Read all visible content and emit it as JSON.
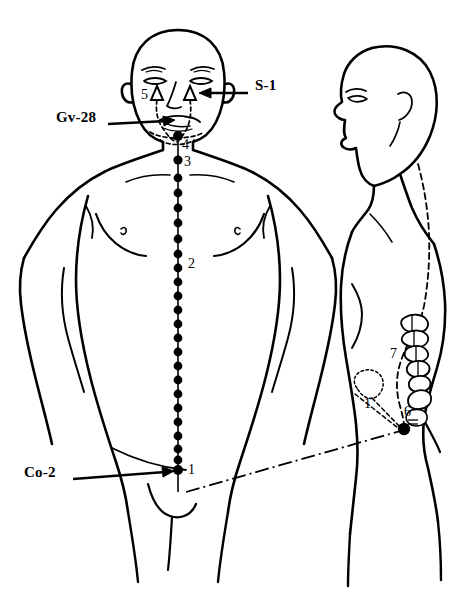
{
  "figure": {
    "background_color": "#ffffff",
    "ink_color": "#000000"
  },
  "views": {
    "front": {
      "name": "anterior full-body view",
      "midline_points_count": 24,
      "midline_top_y": 136,
      "midline_bottom_y": 470,
      "midline_x": 178
    },
    "side": {
      "name": "lateral view of head, trunk and pelvis with sacrum and coccyx"
    }
  },
  "callouts": [
    {
      "id": "s1",
      "label": "S-1",
      "text_x": 255,
      "text_y": 86,
      "arrow_from_x": 248,
      "arrow_from_y": 93,
      "arrow_to_x": 203,
      "arrow_to_y": 93
    },
    {
      "id": "gv28",
      "label": "Gv-28",
      "text_x": 56,
      "text_y": 118,
      "arrow_from_x": 108,
      "arrow_from_y": 125,
      "arrow_to_x": 172,
      "arrow_to_y": 120
    },
    {
      "id": "co2",
      "label": "Co-2",
      "text_x": 24,
      "text_y": 473,
      "arrow_from_x": 73,
      "arrow_from_y": 480,
      "arrow_to_x": 172,
      "arrow_to_y": 470
    }
  ],
  "numbered_markers": [
    {
      "id": "m5",
      "label": "5",
      "x": 147,
      "y": 96,
      "view": "front",
      "note": "triangle marker under left eye"
    },
    {
      "id": "m4",
      "label": "4",
      "x": 184,
      "y": 146,
      "view": "front",
      "note": "point below the chin"
    },
    {
      "id": "m3",
      "label": "3",
      "x": 184,
      "y": 163,
      "view": "front",
      "note": "point on the throat"
    },
    {
      "id": "m2",
      "label": "2",
      "x": 190,
      "y": 265,
      "view": "front",
      "note": "point on the sternum / mid chest"
    },
    {
      "id": "m1front",
      "label": "1",
      "x": 190,
      "y": 472,
      "view": "front",
      "note": "lowest point on the anterior midline"
    },
    {
      "id": "m7",
      "label": "7",
      "x": 393,
      "y": 355,
      "view": "side",
      "note": "sacral vertebrae"
    },
    {
      "id": "m1side",
      "label": "1",
      "x": 366,
      "y": 406,
      "view": "side",
      "note": "dotted organ outline"
    },
    {
      "id": "m6",
      "label": "6",
      "x": 406,
      "y": 415,
      "view": "side",
      "note": "point at the coccyx tip"
    }
  ],
  "triangle_markers": [
    {
      "id": "tri-left",
      "x": 157,
      "y": 93,
      "view": "front"
    },
    {
      "id": "tri-right",
      "x": 190,
      "y": 93,
      "view": "front"
    }
  ],
  "connector": {
    "id": "front-to-side-connector",
    "style": "dash-dot",
    "from_x": 186,
    "from_y": 492,
    "to_x": 404,
    "to_y": 430
  }
}
